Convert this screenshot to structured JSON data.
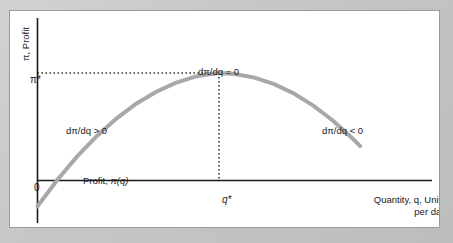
{
  "figure": {
    "panel_background": "#ffffff",
    "page_background": "#c9c9c9",
    "border_color": "#9a9a9a"
  },
  "axes": {
    "y_axis_title": "π, Profit",
    "y_tick_labels": [
      "π*",
      "0"
    ],
    "x_tick_labels": [
      "q*"
    ],
    "x_axis_title_line1": "Quantity, q, Units",
    "x_axis_title_line2": "per day",
    "axis_color": "#1a1a1a"
  },
  "annotations": {
    "peak": "dπ/dq = 0",
    "left_branch": "dπ/dq > 0",
    "right_branch": "dπ/dq < 0",
    "curve_label_prefix": "Profit, ",
    "curve_label_function": "π(q)"
  },
  "chart_data": {
    "type": "line",
    "title": "",
    "subtitle": "",
    "xlabel": "Quantity, q, Units per day",
    "ylabel": "π, Profit",
    "grid": false,
    "legend": null,
    "curve_color": "#a8a8a8",
    "curve_width_px": 4,
    "axis_ranges": {
      "x": [
        0,
        1
      ],
      "y": [
        -0.35,
        1.15
      ]
    },
    "reference_lines": [
      {
        "name": "pi-star-horizontal",
        "orientation": "horizontal",
        "style": "dotted",
        "value_label": "π*",
        "from_x": 0.0,
        "to_x": 0.46,
        "y": 1.0
      },
      {
        "name": "q-star-vertical",
        "orientation": "vertical",
        "style": "dotted",
        "value_label": "q*",
        "x": 0.46,
        "from_y": 0.0,
        "to_y": 1.0
      }
    ],
    "markers": [
      {
        "name": "maximum",
        "x": 0.46,
        "y": 1.0,
        "label": "dπ/dq = 0"
      },
      {
        "name": "lower-breakeven",
        "x": 0.046,
        "y": 0.0,
        "label": ""
      },
      {
        "name": "upper-breakeven",
        "x": 0.804,
        "y": 0.0,
        "label": ""
      }
    ],
    "x": [
      0.0,
      0.05,
      0.1,
      0.15,
      0.2,
      0.25,
      0.3,
      0.35,
      0.4,
      0.425,
      0.46,
      0.5,
      0.55,
      0.6,
      0.65,
      0.7,
      0.75,
      0.8,
      0.818
    ],
    "y": [
      -0.24,
      0.004,
      0.222,
      0.412,
      0.576,
      0.714,
      0.824,
      0.908,
      0.966,
      0.984,
      1.0,
      0.991,
      0.957,
      0.896,
      0.809,
      0.694,
      0.554,
      0.386,
      0.32
    ],
    "y_of_endpoints": {
      "left_end": {
        "x": 0.0,
        "y": -0.24
      },
      "right_end": {
        "x": 0.818,
        "y": -0.24
      }
    }
  }
}
